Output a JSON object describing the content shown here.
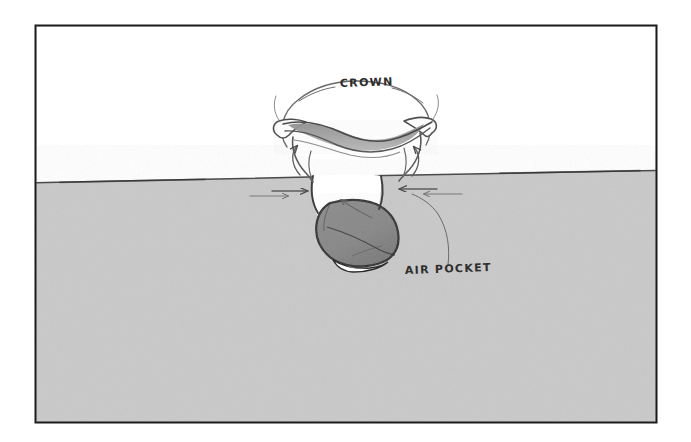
{
  "figure": {
    "medium": "pencil drawing",
    "background_color": "#ffffff",
    "frame": {
      "border_color": "#1c1c1c",
      "x": 35,
      "y": 25,
      "width": 622,
      "height": 398
    },
    "water": {
      "fill_color": "#c9c9c9",
      "surface_left_y": 181,
      "surface_right_y": 171,
      "surface_line_color": "#4a4a4a",
      "label": "water body"
    },
    "air": {
      "fill_color": "#ffffff",
      "label": "air above water surface"
    },
    "cavity": {
      "fill_color": "#8e8e8e",
      "outline_color": "#2b2b2b",
      "highlight_color": "#ffffff",
      "label": "air pocket cavity"
    },
    "crown": {
      "fill_color": "#ffffff",
      "shade_color": "#9a9a9a",
      "outline_color": "#555555",
      "label": "splash crown"
    }
  },
  "labels": {
    "crown": {
      "text": "CROWN",
      "x": 340,
      "y": 86
    },
    "air_pocket": {
      "text": "AIR POCKET",
      "x": 408,
      "y": 272
    }
  },
  "annotations": {
    "leader_lines": [
      {
        "name": "crown-leader-left",
        "from": "CROWN label",
        "to": "crown rim left"
      },
      {
        "name": "crown-leader-right",
        "from": "CROWN label",
        "to": "crown rim right"
      },
      {
        "name": "air-pocket-leader",
        "from": "AIR POCKET label",
        "to": "cavity interior"
      }
    ],
    "flow_arrows": [
      {
        "name": "arrow-crown-inflow-left",
        "direction": "up-left",
        "region": "left crown neck"
      },
      {
        "name": "arrow-crown-inflow-right",
        "direction": "up-right",
        "region": "right crown neck"
      },
      {
        "name": "arrow-water-inward-left",
        "direction": "right",
        "region": "left of cavity neck"
      },
      {
        "name": "arrow-water-inward-right",
        "direction": "left",
        "region": "right of cavity neck"
      },
      {
        "name": "arrow-cavity-pointer",
        "direction": "up-left",
        "region": "cavity throat"
      },
      {
        "name": "arrow-subsurface-left",
        "direction": "right",
        "region": "below surface left"
      },
      {
        "name": "arrow-subsurface-right",
        "direction": "left",
        "region": "below surface right"
      }
    ]
  }
}
